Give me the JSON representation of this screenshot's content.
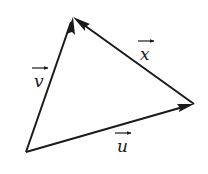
{
  "diagram": {
    "type": "vector-triangle",
    "vertices": {
      "top": [
        73,
        17
      ],
      "bottom_left": [
        26,
        152
      ],
      "right": [
        194,
        104
      ]
    },
    "vectors": [
      {
        "name": "v",
        "label": "v",
        "from": "bottom_left",
        "to": "top",
        "label_pos": [
          38,
          86
        ],
        "arrow_pos": [
          42,
          70
        ]
      },
      {
        "name": "x",
        "label": "x",
        "from": "right",
        "to": "top",
        "label_pos": [
          140,
          60
        ],
        "arrow_pos": [
          146,
          42
        ]
      },
      {
        "name": "u",
        "label": "u",
        "from": "bottom_left",
        "to": "right",
        "label_pos": [
          118,
          152
        ],
        "arrow_pos": [
          124,
          133
        ]
      }
    ],
    "colors": {
      "line": "#1a1a1a",
      "background": "#ffffff"
    }
  }
}
